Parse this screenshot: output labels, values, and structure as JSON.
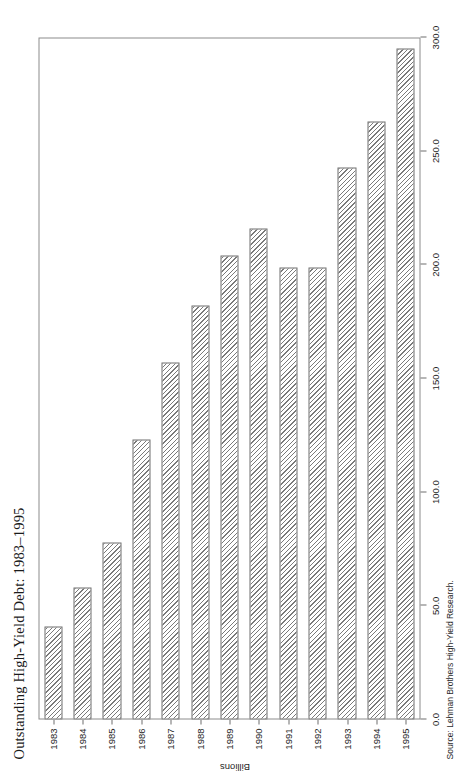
{
  "chart_data": {
    "type": "bar",
    "orientation": "vertical",
    "title": "Outstanding High-Yield Debt: 1983–1995",
    "source": "Source: Lehman Brothers High-Yield Research.",
    "xlabel": "",
    "ylabel": "Billions",
    "categories": [
      "1983",
      "1984",
      "1985",
      "1986",
      "1987",
      "1988",
      "1989",
      "1990",
      "1991",
      "1992",
      "1993",
      "1994",
      "1995"
    ],
    "values": [
      41.0,
      58.0,
      78.0,
      123.0,
      157.0,
      182.0,
      204.0,
      216.0,
      199.0,
      199.0,
      243.0,
      263.0,
      295.0
    ],
    "ylim": [
      0.0,
      300.0
    ],
    "ytick_labels": [
      "0.0",
      "50.0",
      "100.0",
      "150.0",
      "200.0",
      "250.0",
      "300.0"
    ],
    "ytick_values": [
      0.0,
      50.0,
      100.0,
      150.0,
      200.0,
      250.0,
      300.0
    ],
    "grid": false,
    "legend": false,
    "bar_fill": "diagonal-hatch",
    "bar_edge_color": "#6e6e6e",
    "frame_color": "#8c8c8c"
  }
}
